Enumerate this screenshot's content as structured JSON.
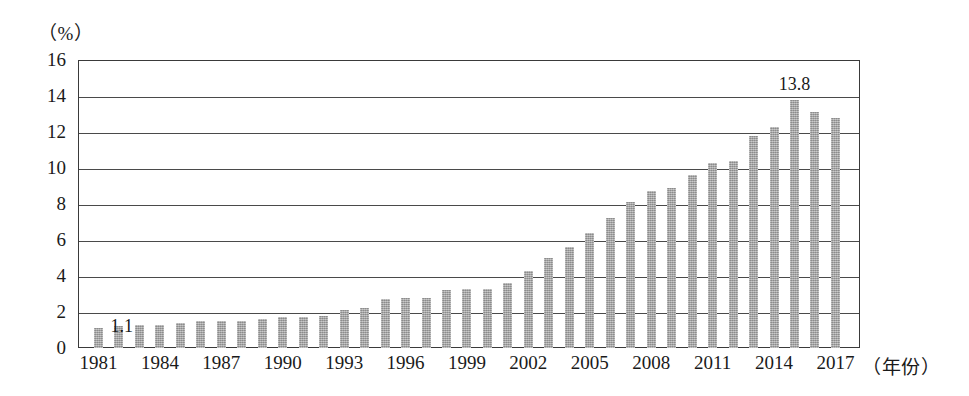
{
  "chart_data": {
    "type": "bar",
    "title": "",
    "subtitle": "",
    "xlabel": "（年份）",
    "ylabel": "（%）",
    "ylim": [
      0,
      16
    ],
    "xlim": [
      1981,
      2017
    ],
    "grid": true,
    "legend": null,
    "y_ticks": [
      0,
      2,
      4,
      6,
      8,
      10,
      12,
      14,
      16
    ],
    "y_tick_labels": [
      "0",
      "2",
      "4",
      "6",
      "8",
      "10",
      "12",
      "14",
      "16"
    ],
    "x_tick_labels": [
      "1981",
      "1984",
      "1987",
      "1990",
      "1993",
      "1996",
      "1999",
      "2002",
      "2005",
      "2008",
      "2011",
      "2014",
      "2017"
    ],
    "x_tick_years": [
      1981,
      1984,
      1987,
      1990,
      1993,
      1996,
      1999,
      2002,
      2005,
      2008,
      2011,
      2014,
      2017
    ],
    "bar_color": "#9b9b9b",
    "categories": [
      "1981",
      "1982",
      "1983",
      "1984",
      "1985",
      "1986",
      "1987",
      "1988",
      "1989",
      "1990",
      "1991",
      "1992",
      "1993",
      "1994",
      "1995",
      "1996",
      "1997",
      "1998",
      "1999",
      "2000",
      "2001",
      "2002",
      "2003",
      "2004",
      "2005",
      "2006",
      "2007",
      "2008",
      "2009",
      "2010",
      "2011",
      "2012",
      "2013",
      "2014",
      "2015",
      "2016",
      "2017"
    ],
    "values": [
      1.1,
      1.2,
      1.3,
      1.3,
      1.4,
      1.5,
      1.5,
      1.5,
      1.6,
      1.7,
      1.7,
      1.8,
      2.1,
      2.2,
      2.7,
      2.8,
      2.8,
      3.2,
      3.3,
      3.3,
      3.6,
      4.3,
      5.0,
      5.6,
      6.4,
      7.2,
      8.1,
      8.7,
      8.9,
      9.6,
      10.3,
      10.4,
      11.8,
      12.3,
      13.8,
      13.1,
      12.8
    ],
    "annotations": [
      {
        "label": "1.1",
        "year": "1981",
        "value": 1.1
      },
      {
        "label": "13.8",
        "year": "2015",
        "value": 13.8
      }
    ]
  }
}
